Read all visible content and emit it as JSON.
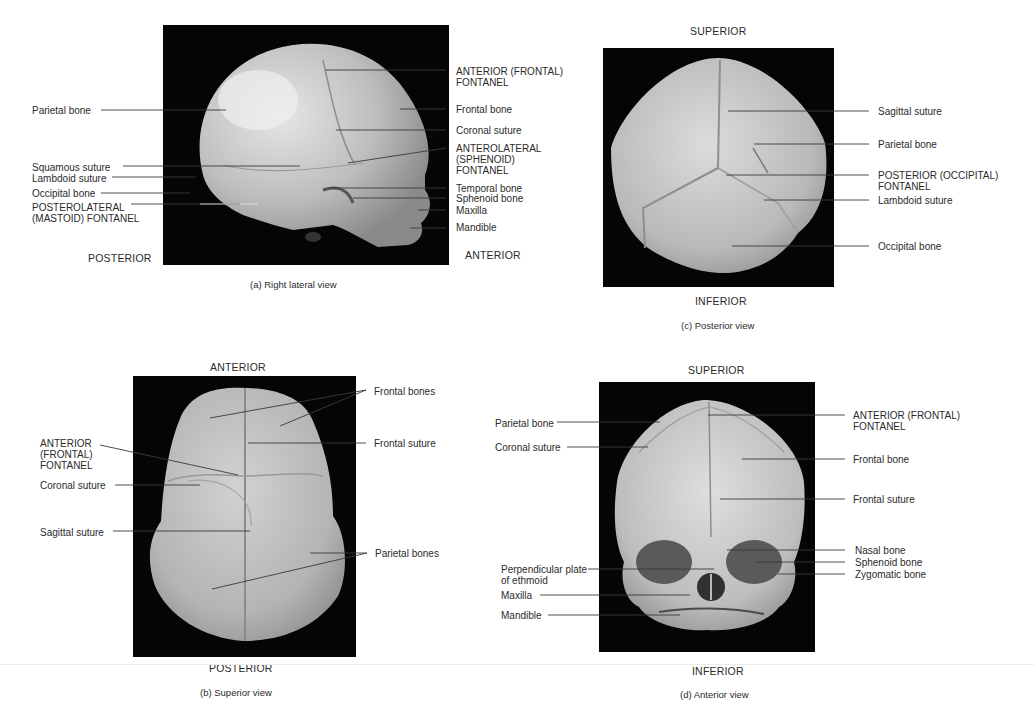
{
  "panels": {
    "a": {
      "caption": "(a) Right lateral view",
      "dir_left": "POSTERIOR",
      "dir_right": "ANTERIOR",
      "labels": {
        "parietal": "Parietal bone",
        "squamous": "Squamous suture",
        "lambdoid": "Lambdoid suture",
        "occipital": "Occipital bone",
        "posterolateral": "POSTEROLATERAL\n(MASTOID) FONTANEL",
        "anterior_fontanel": "ANTERIOR (FRONTAL)\nFONTANEL",
        "frontal": "Frontal bone",
        "coronal": "Coronal suture",
        "anterolateral": "ANTEROLATERAL\n(SPHENOID)\nFONTANEL",
        "temporal": "Temporal bone",
        "sphenoid": "Sphenoid bone",
        "maxilla": "Maxilla",
        "mandible": "Mandible"
      }
    },
    "b": {
      "caption": "(b) Superior view",
      "dir_top": "ANTERIOR",
      "dir_bottom": "POSTERIOR",
      "labels": {
        "frontal_bones": "Frontal bones",
        "frontal_suture": "Frontal suture",
        "anterior_fontanel": "ANTERIOR\n(FRONTAL)\nFONTANEL",
        "coronal": "Coronal suture",
        "sagittal": "Sagittal suture",
        "parietal_bones": "Parietal bones"
      }
    },
    "c": {
      "caption": "(c) Posterior view",
      "dir_top": "SUPERIOR",
      "dir_bottom": "INFERIOR",
      "labels": {
        "sagittal": "Sagittal suture",
        "parietal": "Parietal bone",
        "posterior_fontanel": "POSTERIOR (OCCIPITAL)\nFONTANEL",
        "lambdoid": "Lambdoid suture",
        "occipital": "Occipital bone"
      }
    },
    "d": {
      "caption": "(d) Anterior view",
      "dir_top": "SUPERIOR",
      "dir_bottom": "INFERIOR",
      "labels": {
        "parietal": "Parietal bone",
        "coronal": "Coronal suture",
        "perpendicular": "Perpendicular plate\nof ethmoid",
        "maxilla": "Maxilla",
        "mandible": "Mandible",
        "anterior_fontanel": "ANTERIOR (FRONTAL)\nFONTANEL",
        "frontal": "Frontal bone",
        "frontal_suture": "Frontal suture",
        "nasal": "Nasal bone",
        "sphenoid": "Sphenoid bone",
        "zygomatic": "Zygomatic bone"
      }
    }
  },
  "colors": {
    "photo_background": "#050505",
    "bone": "#c9c9c9",
    "text": "#2b2b2b",
    "leader_line": "#3a3a3a"
  }
}
